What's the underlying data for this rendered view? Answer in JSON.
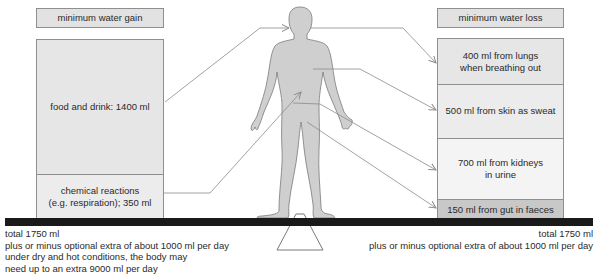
{
  "gain": {
    "header": "minimum water gain",
    "items": [
      {
        "label": "food and drink: 1400 ml",
        "amount_ml": 1400
      },
      {
        "label": "chemical reactions\n(e.g. respiration); 350 ml",
        "amount_ml": 350
      }
    ],
    "total": "total 1750 ml",
    "notes": [
      "plus or minus optional extra of about 1000 ml per day",
      "under dry and hot conditions, the body may",
      "need up to an extra 9000 ml per day"
    ]
  },
  "loss": {
    "header": "minimum water loss",
    "items": [
      {
        "label": "400 ml from lungs\nwhen breathing out",
        "amount_ml": 400
      },
      {
        "label": "500 ml from skin as sweat",
        "amount_ml": 500
      },
      {
        "label": "700 ml from kidneys\nin urine",
        "amount_ml": 700
      },
      {
        "label": "150 ml from gut in faeces",
        "amount_ml": 150
      }
    ],
    "total": "total 1750 ml",
    "notes": [
      "plus or minus optional extra of about 1000 ml per day"
    ]
  },
  "colors": {
    "figure_fill": "#cfcfcf",
    "figure_stroke": "#7a7a7a",
    "arrow": "#8a8a8a",
    "balance_bar": "#1a1a1a",
    "box_border": "#8f8f8f"
  }
}
